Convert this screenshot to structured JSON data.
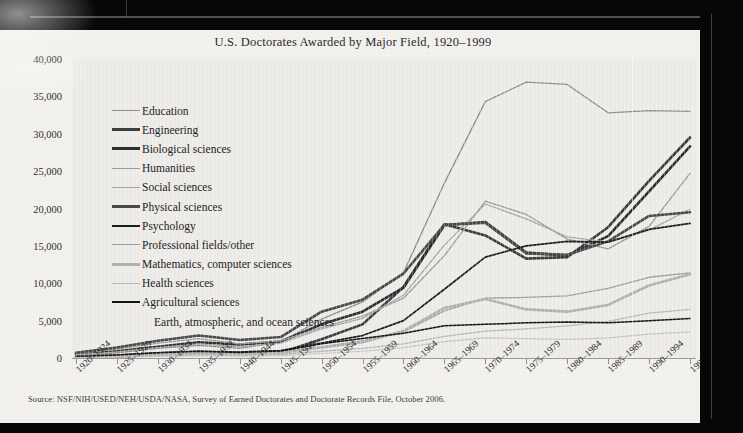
{
  "document": {
    "kind": "scanned-book-page-photograph",
    "page_background": "#f3f2ef",
    "plot_background": "#eceae6",
    "frame_color": "#070707"
  },
  "chart_data": {
    "type": "line",
    "title": "U.S. Doctorates Awarded by Major Field, 1920–1999",
    "xlabel": "",
    "ylabel": "",
    "ylim": [
      0,
      40000
    ],
    "ytick_step": 5000,
    "grid": false,
    "legend_position": "inside-upper-left",
    "source": "Source: NSF/NIH/USED/NEH/USDA/NASA, Survey of Earned Doctorates and Doctorate Records File, October 2006.",
    "categories": [
      "1920–1924",
      "1925–1929",
      "1930–1934",
      "1935–1939",
      "1940–1944",
      "1945–1949",
      "1950–1954",
      "1955–1959",
      "1960–1964",
      "1965–1969",
      "1970–1974",
      "1975–1979",
      "1980–1984",
      "1985–1989",
      "1990–1994",
      "1995–1999"
    ],
    "ytick_labels": [
      "0",
      "5,000",
      "10,000",
      "15,000",
      "20,000",
      "25,000",
      "30,000",
      "35,000",
      "40,000"
    ],
    "ytick_values": [
      0,
      5000,
      10000,
      15000,
      20000,
      25000,
      30000,
      35000,
      40000
    ],
    "series": [
      {
        "name": "Education",
        "color": "#8c8c8c",
        "width": 1.3,
        "values": [
          300,
          700,
          1300,
          1700,
          1300,
          2100,
          5200,
          7500,
          11400,
          23400,
          34300,
          36900,
          36600,
          32800,
          33100,
          33000
        ]
      },
      {
        "name": "Engineering",
        "color": "#3d3d3d",
        "width": 2.6,
        "values": [
          100,
          200,
          400,
          600,
          500,
          700,
          2500,
          4500,
          9500,
          17900,
          16400,
          13300,
          13500,
          17500,
          23700,
          29500
        ]
      },
      {
        "name": "Biological sciences",
        "color": "#2f2f2f",
        "width": 2.6,
        "values": [
          500,
          900,
          1500,
          2100,
          1800,
          2200,
          4500,
          6200,
          9400,
          17800,
          18200,
          14100,
          13700,
          16300,
          22300,
          28300
        ]
      },
      {
        "name": "Humanities",
        "color": "#9a9a9a",
        "width": 1.3,
        "values": [
          600,
          1200,
          2000,
          2600,
          1900,
          2300,
          4100,
          5600,
          8000,
          13700,
          21000,
          19200,
          15900,
          14600,
          17600,
          24700
        ]
      },
      {
        "name": "Social sciences",
        "color": "#a5a5a5",
        "width": 1.3,
        "values": [
          400,
          800,
          1400,
          1900,
          1500,
          2000,
          3900,
          5300,
          8400,
          15100,
          20600,
          18600,
          16200,
          15500,
          17100,
          19900
        ]
      },
      {
        "name": "Physical sciences",
        "color": "#4a4a4a",
        "width": 2.6,
        "values": [
          700,
          1400,
          2300,
          3000,
          2400,
          2800,
          6200,
          7800,
          11300,
          17800,
          18100,
          14000,
          13800,
          15600,
          19000,
          19500
        ]
      },
      {
        "name": "Psychology",
        "color": "#1f1f1f",
        "width": 1.7,
        "values": [
          200,
          400,
          700,
          900,
          800,
          1000,
          2000,
          3000,
          5000,
          9200,
          13500,
          15000,
          15600,
          15500,
          17200,
          18000
        ]
      },
      {
        "name": "Professional fields/other",
        "color": "#9e9e9e",
        "width": 1.3,
        "values": [
          150,
          300,
          500,
          700,
          600,
          800,
          1500,
          2300,
          3500,
          6300,
          8000,
          8100,
          8300,
          9300,
          10800,
          11400
        ]
      },
      {
        "name": "Mathematics, computer sciences",
        "color": "#b0b0b0",
        "width": 2.6,
        "values": [
          120,
          280,
          450,
          650,
          550,
          700,
          1400,
          2100,
          3600,
          6700,
          7900,
          6500,
          6200,
          7100,
          9700,
          11200
        ]
      },
      {
        "name": "Health sciences",
        "color": "#b8b8b8",
        "width": 1.3,
        "values": [
          80,
          180,
          300,
          450,
          380,
          500,
          900,
          1300,
          1900,
          2900,
          3600,
          3900,
          4300,
          4900,
          6000,
          6500
        ]
      },
      {
        "name": "Agricultural sciences",
        "color": "#151515",
        "width": 1.5,
        "values": [
          200,
          400,
          700,
          900,
          750,
          950,
          1900,
          2600,
          3300,
          4300,
          4500,
          4700,
          4800,
          4700,
          5000,
          5300
        ]
      },
      {
        "name": "Earth, atmospheric, and ocean sciences",
        "color": "#c4c4c4",
        "width": 1.2,
        "values": [
          60,
          120,
          200,
          300,
          250,
          320,
          600,
          900,
          1400,
          2200,
          2700,
          2600,
          2500,
          2700,
          3200,
          3500
        ]
      }
    ]
  }
}
